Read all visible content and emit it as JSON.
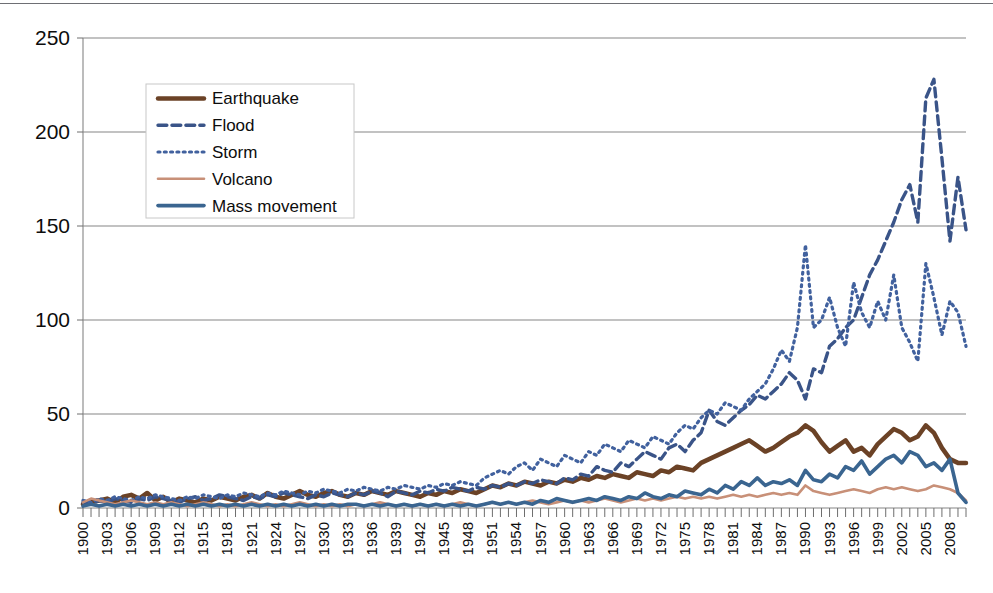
{
  "chart_data": {
    "type": "line",
    "title": "",
    "subtitle": "",
    "xlabel": "",
    "ylabel": "",
    "ylim": [
      0,
      250
    ],
    "xlim": [
      1900,
      2010
    ],
    "y_ticks": [
      0,
      50,
      100,
      150,
      200,
      250
    ],
    "y_tick_labels": [
      "0",
      "50",
      "100",
      "150",
      "200",
      "250"
    ],
    "grid": "horizontal",
    "legend_position": "upper-left-inside",
    "x_tick_step": 3,
    "x_tick_labels": [
      "1900",
      "1903",
      "1906",
      "1909",
      "1912",
      "1915",
      "1918",
      "1921",
      "1924",
      "1927",
      "1930",
      "1933",
      "1936",
      "1939",
      "1942",
      "1945",
      "1948",
      "1951",
      "1954",
      "1957",
      "1960",
      "1963",
      "1966",
      "1969",
      "1972",
      "1975",
      "1978",
      "1981",
      "1984",
      "1987",
      "1990",
      "1993",
      "1996",
      "1999",
      "2002",
      "2005",
      "2008"
    ],
    "x": [
      1900,
      1901,
      1902,
      1903,
      1904,
      1905,
      1906,
      1907,
      1908,
      1909,
      1910,
      1911,
      1912,
      1913,
      1914,
      1915,
      1916,
      1917,
      1918,
      1919,
      1920,
      1921,
      1922,
      1923,
      1924,
      1925,
      1926,
      1927,
      1928,
      1929,
      1930,
      1931,
      1932,
      1933,
      1934,
      1935,
      1936,
      1937,
      1938,
      1939,
      1940,
      1941,
      1942,
      1943,
      1944,
      1945,
      1946,
      1947,
      1948,
      1949,
      1950,
      1951,
      1952,
      1953,
      1954,
      1955,
      1956,
      1957,
      1958,
      1959,
      1960,
      1961,
      1962,
      1963,
      1964,
      1965,
      1966,
      1967,
      1968,
      1969,
      1970,
      1971,
      1972,
      1973,
      1974,
      1975,
      1976,
      1977,
      1978,
      1979,
      1980,
      1981,
      1982,
      1983,
      1984,
      1985,
      1986,
      1987,
      1988,
      1989,
      1990,
      1991,
      1992,
      1993,
      1994,
      1995,
      1996,
      1997,
      1998,
      1999,
      2000,
      2001,
      2002,
      2003,
      2004,
      2005,
      2006,
      2007,
      2008,
      2009,
      2010
    ],
    "series": [
      {
        "name": "Earthquake",
        "color": "#6B4226",
        "linestyle": "solid-thick",
        "width": 4.5,
        "values": [
          2,
          3,
          4,
          5,
          3,
          6,
          7,
          5,
          8,
          4,
          6,
          3,
          5,
          4,
          3,
          5,
          4,
          6,
          5,
          4,
          6,
          7,
          5,
          8,
          6,
          5,
          7,
          9,
          7,
          6,
          8,
          9,
          7,
          6,
          8,
          7,
          9,
          8,
          7,
          9,
          8,
          7,
          6,
          8,
          7,
          9,
          8,
          10,
          9,
          8,
          10,
          12,
          11,
          13,
          12,
          14,
          13,
          12,
          14,
          13,
          15,
          14,
          16,
          15,
          17,
          16,
          18,
          17,
          16,
          19,
          18,
          17,
          20,
          19,
          22,
          21,
          20,
          24,
          26,
          28,
          30,
          32,
          34,
          36,
          33,
          30,
          32,
          35,
          38,
          40,
          44,
          41,
          35,
          30,
          33,
          36,
          30,
          32,
          28,
          34,
          38,
          42,
          40,
          36,
          38,
          44,
          40,
          32,
          26,
          24,
          24
        ]
      },
      {
        "name": "Flood",
        "color": "#3A5488",
        "linestyle": "dashed",
        "width": 3.4,
        "values": [
          3,
          2,
          4,
          3,
          5,
          4,
          3,
          5,
          4,
          6,
          5,
          4,
          3,
          5,
          6,
          4,
          5,
          7,
          6,
          5,
          4,
          6,
          5,
          7,
          6,
          8,
          7,
          6,
          5,
          7,
          6,
          8,
          7,
          6,
          8,
          7,
          9,
          8,
          6,
          9,
          8,
          7,
          9,
          8,
          10,
          9,
          11,
          10,
          9,
          11,
          10,
          12,
          11,
          13,
          12,
          14,
          13,
          15,
          14,
          13,
          16,
          15,
          18,
          17,
          22,
          20,
          19,
          24,
          22,
          26,
          30,
          28,
          26,
          32,
          34,
          30,
          36,
          40,
          52,
          46,
          44,
          48,
          52,
          55,
          60,
          58,
          62,
          66,
          72,
          68,
          58,
          74,
          72,
          86,
          90,
          96,
          100,
          112,
          124,
          132,
          142,
          152,
          164,
          172,
          152,
          218,
          228,
          186,
          142,
          176,
          148
        ]
      },
      {
        "name": "Storm",
        "color": "#41619E",
        "linestyle": "dotted",
        "width": 3.2,
        "values": [
          4,
          3,
          5,
          4,
          6,
          5,
          4,
          6,
          5,
          7,
          6,
          5,
          4,
          6,
          5,
          7,
          6,
          5,
          7,
          6,
          8,
          7,
          6,
          8,
          7,
          9,
          8,
          7,
          9,
          8,
          10,
          9,
          8,
          10,
          9,
          11,
          10,
          9,
          11,
          10,
          12,
          11,
          10,
          12,
          11,
          13,
          12,
          14,
          13,
          12,
          16,
          18,
          20,
          18,
          22,
          24,
          20,
          26,
          24,
          22,
          28,
          26,
          24,
          30,
          28,
          34,
          32,
          30,
          36,
          34,
          32,
          38,
          36,
          34,
          40,
          44,
          42,
          48,
          52,
          50,
          56,
          54,
          52,
          58,
          62,
          66,
          74,
          84,
          78,
          96,
          140,
          96,
          100,
          112,
          96,
          86,
          120,
          104,
          96,
          110,
          100,
          124,
          96,
          88,
          78,
          130,
          112,
          92,
          110,
          104,
          86
        ]
      },
      {
        "name": "Volcano",
        "color": "#C89078",
        "linestyle": "solid",
        "width": 2.6,
        "values": [
          3,
          5,
          4,
          3,
          2,
          3,
          4,
          3,
          2,
          3,
          2,
          3,
          2,
          1,
          2,
          3,
          2,
          1,
          2,
          1,
          2,
          3,
          2,
          1,
          2,
          1,
          2,
          3,
          2,
          1,
          2,
          1,
          2,
          1,
          2,
          1,
          2,
          3,
          2,
          1,
          2,
          1,
          2,
          1,
          2,
          1,
          2,
          3,
          2,
          1,
          2,
          3,
          2,
          3,
          2,
          3,
          4,
          3,
          2,
          3,
          4,
          3,
          4,
          3,
          4,
          5,
          4,
          3,
          4,
          5,
          4,
          5,
          4,
          5,
          6,
          5,
          6,
          5,
          6,
          5,
          6,
          7,
          6,
          7,
          6,
          7,
          8,
          7,
          8,
          7,
          12,
          9,
          8,
          7,
          8,
          9,
          10,
          9,
          8,
          10,
          11,
          10,
          11,
          10,
          9,
          10,
          12,
          11,
          10,
          8,
          4
        ]
      },
      {
        "name": "Mass movement",
        "color": "#3A6590",
        "linestyle": "solid",
        "width": 3.6,
        "values": [
          1,
          2,
          1,
          2,
          1,
          2,
          1,
          2,
          1,
          2,
          1,
          2,
          1,
          2,
          1,
          2,
          1,
          2,
          1,
          2,
          1,
          2,
          1,
          2,
          1,
          2,
          1,
          2,
          1,
          2,
          1,
          2,
          1,
          2,
          2,
          1,
          2,
          1,
          2,
          1,
          2,
          1,
          2,
          1,
          2,
          1,
          2,
          1,
          2,
          1,
          2,
          3,
          2,
          3,
          2,
          3,
          2,
          4,
          3,
          5,
          4,
          3,
          4,
          5,
          4,
          6,
          5,
          4,
          6,
          5,
          8,
          6,
          5,
          7,
          6,
          9,
          8,
          7,
          10,
          8,
          12,
          10,
          14,
          12,
          16,
          12,
          14,
          13,
          15,
          12,
          20,
          15,
          14,
          18,
          16,
          22,
          20,
          25,
          18,
          22,
          26,
          28,
          24,
          30,
          28,
          22,
          24,
          20,
          26,
          8,
          3
        ]
      }
    ]
  },
  "legend": {
    "items": [
      {
        "label": "Earthquake",
        "color": "#6B4226",
        "style": "solid-thick"
      },
      {
        "label": "Flood",
        "color": "#3A5488",
        "style": "dashed"
      },
      {
        "label": "Storm",
        "color": "#41619E",
        "style": "dotted"
      },
      {
        "label": "Volcano",
        "color": "#C89078",
        "style": "solid"
      },
      {
        "label": "Mass movement",
        "color": "#3A6590",
        "style": "solid"
      }
    ]
  },
  "axes": {
    "y_labels": [
      "250",
      "200",
      "150",
      "100",
      "50",
      "0"
    ],
    "x_first": "1900",
    "x_last": "2008"
  }
}
